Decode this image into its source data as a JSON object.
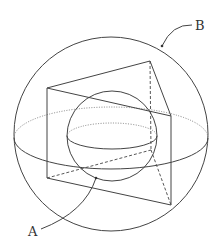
{
  "diagram": {
    "labels": {
      "outer_sphere": "B",
      "inner_sphere": "A"
    },
    "stroke_color": "#444444",
    "background": "#ffffff"
  }
}
